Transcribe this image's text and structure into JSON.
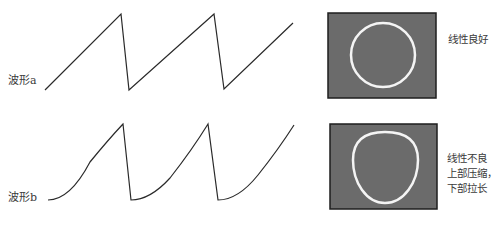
{
  "waveforms": [
    {
      "label": "波形a",
      "description": "linear sawtooth"
    },
    {
      "label": "波形b",
      "description": "nonlinear sawtooth (concave rise)"
    }
  ],
  "screens": [
    {
      "note_lines": [
        "线性良好"
      ],
      "shape": "circle"
    },
    {
      "note_lines": [
        "线性不良",
        "上部压缩，",
        "下部拉长"
      ],
      "shape": "egg"
    }
  ],
  "colors": {
    "line": "#2a2a2a",
    "screen_bg": "#6b6b6b",
    "screen_border": "#1e1e1e",
    "trace": "#f4f4f4"
  }
}
